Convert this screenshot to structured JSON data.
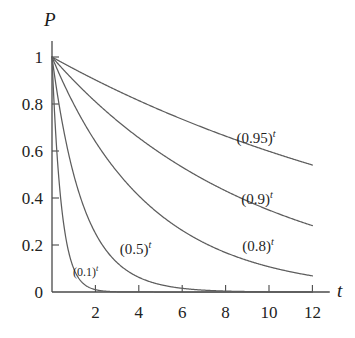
{
  "chart_data": {
    "type": "line",
    "title": "",
    "subtitle": "",
    "xlabel": "t",
    "ylabel": "P",
    "xlim": [
      0,
      12.8
    ],
    "ylim": [
      0,
      1.06
    ],
    "xticks": [
      2,
      4,
      6,
      8,
      10,
      12
    ],
    "xtick_labels": [
      "2",
      "4",
      "6",
      "8",
      "10",
      "12"
    ],
    "yticks": [
      0,
      0.2,
      0.4,
      0.6,
      0.8,
      1
    ],
    "ytick_labels": [
      "0",
      "0.2",
      "0.4",
      "0.6",
      "0.8",
      "1"
    ],
    "grid": false,
    "legend": "inline-curve-labels",
    "curve_color": "#5d5d5d",
    "axis_color": "#4a4a4a",
    "text_color": "#1f1f1f",
    "x": [
      0,
      0.5,
      1,
      1.5,
      2,
      2.5,
      3,
      3.5,
      4,
      4.5,
      5,
      5.5,
      6,
      6.5,
      7,
      7.5,
      8,
      8.5,
      9,
      9.5,
      10,
      10.5,
      11,
      11.5,
      12
    ],
    "series": [
      {
        "name": "(0.95)^t",
        "base": 0.95,
        "label": "(0.95)",
        "exponent": "t",
        "label_at": {
          "t": 9.4,
          "p": 0.655
        },
        "values": [
          1,
          0.9747,
          0.95,
          0.926,
          0.9025,
          0.8797,
          0.8574,
          0.8357,
          0.8145,
          0.7939,
          0.7738,
          0.7542,
          0.735,
          0.7164,
          0.6983,
          0.6806,
          0.6634,
          0.6466,
          0.6302,
          0.6143,
          0.5987,
          0.5836,
          0.5688,
          0.5544,
          0.5404
        ]
      },
      {
        "name": "(0.9)^t",
        "base": 0.9,
        "label": "(0.9)",
        "exponent": "t",
        "label_at": {
          "t": 9.45,
          "p": 0.395
        },
        "values": [
          1,
          0.9487,
          0.9,
          0.8538,
          0.81,
          0.7684,
          0.729,
          0.6916,
          0.6561,
          0.6224,
          0.5905,
          0.5601,
          0.5314,
          0.5041,
          0.4783,
          0.4537,
          0.4305,
          0.4084,
          0.3874,
          0.3675,
          0.3487,
          0.3308,
          0.3138,
          0.2977,
          0.2824
        ]
      },
      {
        "name": "(0.8)^t",
        "base": 0.8,
        "label": "(0.8)",
        "exponent": "t",
        "label_at": {
          "t": 9.5,
          "p": 0.195
        },
        "values": [
          1,
          0.8944,
          0.8,
          0.7155,
          0.64,
          0.5724,
          0.512,
          0.4579,
          0.4096,
          0.3664,
          0.3277,
          0.2931,
          0.2621,
          0.2345,
          0.2097,
          0.1876,
          0.1678,
          0.1501,
          0.1342,
          0.1201,
          0.1074,
          0.0961,
          0.0859,
          0.0768,
          0.0687
        ]
      },
      {
        "name": "(0.5)^t",
        "base": 0.5,
        "label": "(0.5)",
        "exponent": "t",
        "label_at": {
          "t": 3.85,
          "p": 0.185
        },
        "values": [
          1,
          0.7071,
          0.5,
          0.3536,
          0.25,
          0.1768,
          0.125,
          0.0884,
          0.0625,
          0.0442,
          0.0313,
          0.0221,
          0.0156,
          0.011,
          0.0078,
          0.0055,
          0.0039,
          0.0028,
          0.002,
          0.0014,
          0.001,
          0.0007,
          0.0005,
          0.0003,
          0.0002
        ]
      },
      {
        "name": "(0.1)^t",
        "base": 0.1,
        "label": "(0.1)",
        "exponent": "t",
        "label_at": {
          "t": 1.55,
          "p": 0.085
        },
        "values": [
          1,
          0.3162,
          0.1,
          0.0316,
          0.01,
          0.0032,
          0.001,
          0.0003,
          0.0001,
          0,
          0,
          0,
          0,
          0,
          0,
          0,
          0,
          0,
          0,
          0,
          0,
          0,
          0,
          0,
          0
        ]
      }
    ]
  },
  "axes": {
    "y_label": "P",
    "x_label": "t"
  }
}
